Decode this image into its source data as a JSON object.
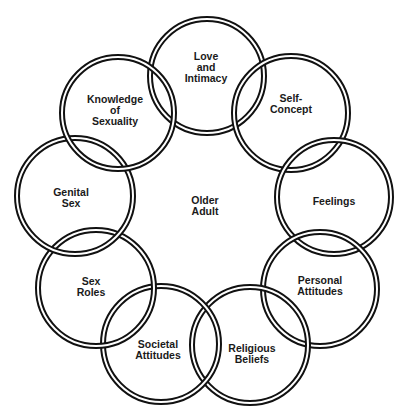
{
  "diagram": {
    "center_label": "Older\nAdult",
    "center": {
      "x": 205,
      "y": 206
    },
    "ring_color": "#111111",
    "circles": [
      {
        "label": "Love\nand\nIntimacy",
        "cx": 207,
        "cy": 76,
        "r": 57,
        "lx": 206,
        "ly": 67
      },
      {
        "label": "Self-\nConcept",
        "cx": 291,
        "cy": 113,
        "r": 57,
        "lx": 291,
        "ly": 104
      },
      {
        "label": "Feelings",
        "cx": 334,
        "cy": 197,
        "r": 57,
        "lx": 334,
        "ly": 201
      },
      {
        "label": "Personal\nAttitudes",
        "cx": 320,
        "cy": 289,
        "r": 57,
        "lx": 320,
        "ly": 286
      },
      {
        "label": "Religious\nBeliefs",
        "cx": 250,
        "cy": 345,
        "r": 58,
        "lx": 252,
        "ly": 354
      },
      {
        "label": "Societal\nAttitudes",
        "cx": 161,
        "cy": 344,
        "r": 58,
        "lx": 158,
        "ly": 350
      },
      {
        "label": "Sex\nRoles",
        "cx": 96,
        "cy": 288,
        "r": 58,
        "lx": 91,
        "ly": 287
      },
      {
        "label": "Genital\nSex",
        "cx": 75,
        "cy": 196,
        "r": 58,
        "lx": 71,
        "ly": 198
      },
      {
        "label": "Knowledge\nof\nSexuality",
        "cx": 118,
        "cy": 113,
        "r": 56,
        "lx": 115,
        "ly": 110
      }
    ]
  }
}
